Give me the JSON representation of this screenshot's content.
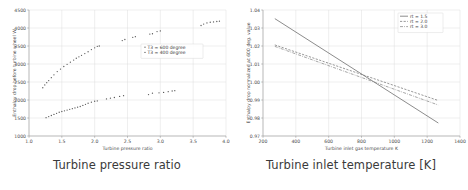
{
  "figure": {
    "panels": [
      {
        "id": "left",
        "caption": "Turbine pressure ratio",
        "chart_data": {
          "type": "scatter",
          "title": "",
          "xlabel": "Turbine pressure ratio",
          "ylabel": "Enthalpy drop before turbine wheel W",
          "xlim": [
            1.0,
            4.0
          ],
          "ylim": [
            1000,
            4500
          ],
          "xticks": [
            "1.0",
            "1.5",
            "2.0",
            "2.5",
            "3.0",
            "3.5",
            "4.0"
          ],
          "xtickvals": [
            1.0,
            1.5,
            2.0,
            2.5,
            3.0,
            3.5,
            4.0
          ],
          "yticks": [
            "1000",
            "1500",
            "2000",
            "2500",
            "3000",
            "3500",
            "4000",
            "4500"
          ],
          "ytickvals": [
            1000,
            1500,
            2000,
            2500,
            3000,
            3500,
            4000,
            4500
          ],
          "grid": true,
          "legend_position": "center-right",
          "marker": "dot",
          "series": [
            {
              "name": "T3 = 600 degree",
              "color": "#555555",
              "x": [
                1.21,
                1.24,
                1.27,
                1.3,
                1.34,
                1.38,
                1.43,
                1.48,
                1.53,
                1.58,
                1.63,
                1.68,
                1.72,
                1.76,
                1.8,
                1.85,
                1.9,
                1.95,
                2.0,
                2.04,
                2.07,
                2.42,
                2.46,
                2.58,
                2.62,
                2.84,
                2.88,
                2.95,
                3.0,
                3.62,
                3.66,
                3.71,
                3.76,
                3.81,
                3.86,
                3.9
              ],
              "y": [
                2340,
                2420,
                2480,
                2540,
                2620,
                2700,
                2790,
                2860,
                2930,
                2990,
                3050,
                3110,
                3160,
                3200,
                3240,
                3290,
                3340,
                3400,
                3450,
                3490,
                3500,
                3650,
                3680,
                3740,
                3760,
                3830,
                3840,
                3900,
                3920,
                4070,
                4110,
                4140,
                4160,
                4170,
                4180,
                4190
              ]
            },
            {
              "name": "T3 = 400 degree",
              "color": "#555555",
              "x": [
                1.26,
                1.3,
                1.34,
                1.38,
                1.42,
                1.46,
                1.5,
                1.54,
                1.58,
                1.62,
                1.66,
                1.7,
                1.74,
                1.78,
                1.82,
                1.86,
                1.9,
                1.95,
                2.0,
                2.04,
                2.18,
                2.24,
                2.3,
                2.38,
                2.44,
                2.82,
                2.88,
                2.98,
                3.05,
                3.12,
                3.18,
                3.22
              ],
              "y": [
                1510,
                1540,
                1570,
                1600,
                1630,
                1660,
                1680,
                1700,
                1720,
                1740,
                1760,
                1780,
                1800,
                1820,
                1850,
                1880,
                1910,
                1940,
                1965,
                1975,
                2030,
                2050,
                2070,
                2100,
                2120,
                2150,
                2190,
                2200,
                2210,
                2230,
                2250,
                2260
              ]
            }
          ]
        }
      },
      {
        "id": "right",
        "caption": "Turbine inlet temperature [K]",
        "chart_data": {
          "type": "line",
          "title": "",
          "xlabel": "Turbine inlet gas temperature K",
          "ylabel": "Enthalpy drop normalized at 600 deg. value",
          "xlim": [
            200,
            1400
          ],
          "ylim": [
            0.97,
            1.04
          ],
          "xticks": [
            "200",
            "400",
            "600",
            "800",
            "1000",
            "1200",
            "1400"
          ],
          "xtickvals": [
            200,
            400,
            600,
            800,
            1000,
            1200,
            1400
          ],
          "yticks": [
            "0.97",
            "0.98",
            "0.99",
            "1.00",
            "1.01",
            "1.02",
            "1.03",
            "1.04"
          ],
          "ytickvals": [
            0.97,
            0.98,
            0.99,
            1.0,
            1.01,
            1.02,
            1.03,
            1.04
          ],
          "grid": true,
          "legend_position": "top-right",
          "series": [
            {
              "name": "rt = 1.5",
              "color": "#666666",
              "dash": "none",
              "x": [
                272,
                1268
              ],
              "y": [
                1.0352,
                0.9772
              ]
            },
            {
              "name": "rt = 2.0",
              "color": "#777777",
              "dash": "dashed",
              "x": [
                272,
                1268
              ],
              "y": [
                1.0206,
                0.9897
              ]
            },
            {
              "name": "rt = 3.0",
              "color": "#888888",
              "dash": "dashdot",
              "x": [
                272,
                1268
              ],
              "y": [
                1.0198,
                0.9872
              ]
            }
          ]
        }
      }
    ]
  }
}
